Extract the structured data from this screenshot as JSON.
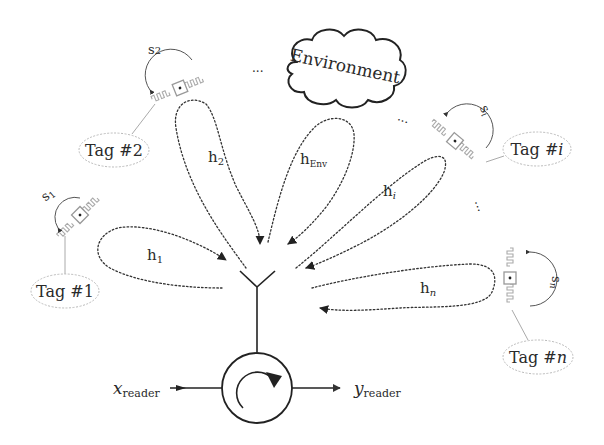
{
  "diagram": {
    "environment": {
      "label": "Environment"
    },
    "reader": {
      "input_label": "x",
      "input_sub": "reader",
      "output_label": "y",
      "output_sub": "reader"
    },
    "tags": [
      {
        "id": "tag-1",
        "label": "Tag #1",
        "state": "s",
        "state_sub": "1",
        "channel": "h",
        "channel_sub": "1"
      },
      {
        "id": "tag-2",
        "label": "Tag #2",
        "state": "s",
        "state_sub": "2",
        "channel": "h",
        "channel_sub": "2"
      },
      {
        "id": "tag-i",
        "label_prefix": "Tag #",
        "label_var": "i",
        "state": "s",
        "state_sub": "i",
        "channel": "h",
        "channel_sub": "i"
      },
      {
        "id": "tag-n",
        "label_prefix": "Tag #",
        "label_var": "n",
        "state": "s",
        "state_sub": "n",
        "channel": "h",
        "channel_sub": "n"
      }
    ],
    "env_channel": {
      "channel": "h",
      "channel_sub": "Env"
    },
    "ellipsis": "..."
  },
  "colors": {
    "line": "#222222",
    "tag_outline": "#bbbbbb",
    "text": "#2a2a2a"
  }
}
